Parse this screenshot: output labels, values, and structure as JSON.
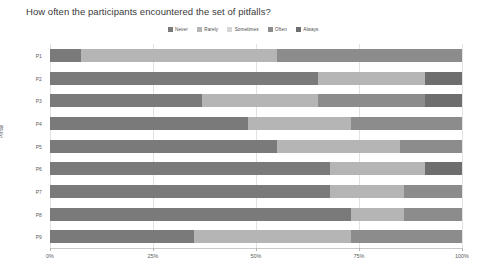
{
  "chart_data": {
    "type": "bar",
    "orientation": "horizontal",
    "stacked": true,
    "normalized": true,
    "title": "How often the participants encountered the set of pitfalls?",
    "xlabel": "",
    "ylabel": "Pitfall",
    "xlim": [
      0,
      100
    ],
    "xticks": [
      "0%",
      "25%",
      "50%",
      "75%",
      "100%"
    ],
    "xtick_values": [
      0,
      25,
      50,
      75,
      100
    ],
    "grid": true,
    "legend_position": "top-center",
    "categories": [
      "P1",
      "P2",
      "P3",
      "P4",
      "P5",
      "P6",
      "P7",
      "P8",
      "P9"
    ],
    "series": [
      {
        "name": "Never",
        "color": "#7a7a7a",
        "values": [
          7.5,
          65.0,
          37.0,
          48.0,
          55.0,
          68.0,
          68.0,
          73.0,
          35.0
        ]
      },
      {
        "name": "Rarely",
        "color": "#b5b5b5",
        "values": [
          47.5,
          26.0,
          28.0,
          25.0,
          30.0,
          23.0,
          18.0,
          13.0,
          38.0
        ]
      },
      {
        "name": "Sometimes",
        "color": "#d6d6d6",
        "values": [
          0.0,
          0.0,
          0.0,
          0.0,
          0.0,
          0.0,
          0.0,
          0.0,
          0.0
        ]
      },
      {
        "name": "Often",
        "color": "#8c8c8c",
        "values": [
          45.0,
          0.0,
          26.0,
          27.0,
          15.0,
          0.0,
          14.0,
          14.0,
          27.0
        ]
      },
      {
        "name": "Always",
        "color": "#6e6e6e",
        "values": [
          0.0,
          9.0,
          9.0,
          0.0,
          0.0,
          9.0,
          0.0,
          0.0,
          0.0
        ]
      }
    ]
  },
  "legend": {
    "items": [
      {
        "label": "Never",
        "color": "#7a7a7a"
      },
      {
        "label": "Rarely",
        "color": "#b5b5b5"
      },
      {
        "label": "Sometimes",
        "color": "#d6d6d6"
      },
      {
        "label": "Often",
        "color": "#8c8c8c"
      },
      {
        "label": "Always",
        "color": "#6e6e6e"
      }
    ]
  },
  "colors": {
    "background": "#ffffff",
    "grid": "#e2e2e2",
    "axis": "#c9c9c9",
    "text": "#5a5a5a",
    "title_text": "#3a3a3a"
  }
}
